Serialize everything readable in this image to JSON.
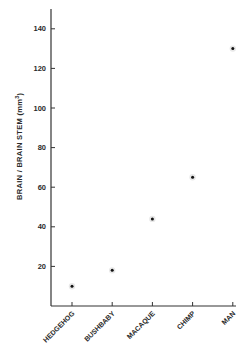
{
  "chart_data": {
    "type": "scatter",
    "title": "",
    "xlabel": "",
    "ylabel": "BRAIN / BRAIN STEM (mm³)",
    "ylabel_parts": {
      "main": "BRAIN  /  BRAIN  STEM  (mm",
      "sup": "3",
      "close": ")"
    },
    "categories": [
      "HEDGEHOG",
      "BUSHBABY",
      "MACAQUE",
      "CHIMP",
      "MAN"
    ],
    "values": [
      10,
      18,
      44,
      65,
      130
    ],
    "yticks": [
      20,
      40,
      60,
      80,
      100,
      120,
      140
    ],
    "ylim": [
      0,
      150
    ],
    "grid": false,
    "legend": null,
    "marker_color": "#111111"
  }
}
